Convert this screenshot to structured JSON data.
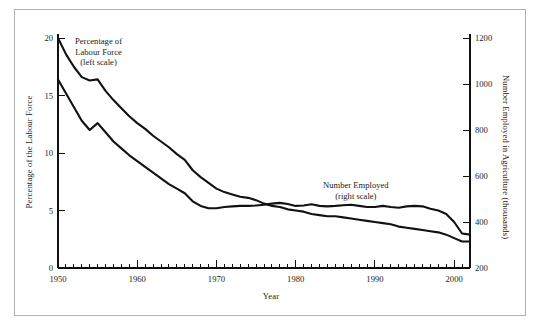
{
  "figure": {
    "background": "#ffffff",
    "border_color": "#b0b0b0",
    "line_color": "#111111"
  },
  "chart_data": {
    "type": "line",
    "title": "",
    "xlabel": "Year",
    "ylabel": "Percentage of the Labour Force",
    "ylabel_right": "Number Employed in Agriculture (thousands)",
    "xlim": [
      1950,
      2002
    ],
    "ylim": [
      0,
      20
    ],
    "ylim_right": [
      200,
      1200
    ],
    "grid": false,
    "legend_position": "inline-annotations",
    "xticks": [
      1950,
      1960,
      1970,
      1980,
      1990,
      2000
    ],
    "xtick_labels": [
      "1950",
      "1960",
      "1970",
      "1980",
      "1990",
      "2000"
    ],
    "minor_xtick_interval": 1,
    "yticks": [
      0,
      5,
      10,
      15,
      20
    ],
    "ytick_labels": [
      "0",
      "5",
      "10",
      "15",
      "20"
    ],
    "yticks_right": [
      200,
      400,
      600,
      800,
      1000,
      1200
    ],
    "ytick_labels_right": [
      "200",
      "400",
      "600",
      "800",
      "1000",
      "1200"
    ],
    "annotations": [
      {
        "id": "left-series",
        "lines": [
          "Percentage of",
          "Labour Force",
          "(left scale)"
        ],
        "x": 1954.5,
        "y": 18.6
      },
      {
        "id": "right-series",
        "lines": [
          "Number Employed",
          "(right scale)"
        ],
        "x": 1985.0,
        "y": 7.2
      }
    ],
    "series": [
      {
        "name": "Percentage of Labour Force (left scale)",
        "axis": "left",
        "units": "percent",
        "x": [
          1950,
          1951,
          1952,
          1953,
          1954,
          1955,
          1956,
          1957,
          1958,
          1959,
          1960,
          1961,
          1962,
          1963,
          1964,
          1965,
          1966,
          1967,
          1968,
          1969,
          1970,
          1971,
          1972,
          1973,
          1974,
          1975,
          1976,
          1977,
          1978,
          1979,
          1980,
          1981,
          1982,
          1983,
          1984,
          1985,
          1986,
          1987,
          1988,
          1989,
          1990,
          1991,
          1992,
          1993,
          1994,
          1995,
          1996,
          1997,
          1998,
          1999,
          2000,
          2001,
          2002
        ],
        "values": [
          20.0,
          18.6,
          17.5,
          16.6,
          16.3,
          16.4,
          15.4,
          14.6,
          13.9,
          13.2,
          12.6,
          12.1,
          11.5,
          11.0,
          10.5,
          9.9,
          9.4,
          8.5,
          7.9,
          7.4,
          6.9,
          6.6,
          6.4,
          6.2,
          6.1,
          5.9,
          5.6,
          5.4,
          5.3,
          5.1,
          5.0,
          4.9,
          4.7,
          4.6,
          4.5,
          4.5,
          4.4,
          4.3,
          4.2,
          4.1,
          4.0,
          3.9,
          3.8,
          3.6,
          3.5,
          3.4,
          3.3,
          3.2,
          3.1,
          2.9,
          2.6,
          2.3,
          2.3
        ]
      },
      {
        "name": "Number Employed in Agriculture (right scale)",
        "axis": "right",
        "units": "thousands",
        "x": [
          1950,
          1951,
          1952,
          1953,
          1954,
          1955,
          1956,
          1957,
          1958,
          1959,
          1960,
          1961,
          1962,
          1963,
          1964,
          1965,
          1966,
          1967,
          1968,
          1969,
          1970,
          1971,
          1972,
          1973,
          1974,
          1975,
          1976,
          1977,
          1978,
          1979,
          1980,
          1981,
          1982,
          1983,
          1984,
          1985,
          1986,
          1987,
          1988,
          1989,
          1990,
          1991,
          1992,
          1993,
          1994,
          1995,
          1996,
          1997,
          1998,
          1999,
          2000,
          2001,
          2002
        ],
        "values": [
          1020,
          960,
          900,
          840,
          800,
          830,
          790,
          750,
          720,
          690,
          665,
          640,
          615,
          590,
          565,
          545,
          525,
          490,
          470,
          460,
          460,
          465,
          468,
          470,
          470,
          472,
          475,
          480,
          483,
          478,
          470,
          472,
          477,
          470,
          468,
          470,
          473,
          475,
          470,
          465,
          465,
          470,
          465,
          462,
          468,
          470,
          468,
          458,
          450,
          435,
          400,
          350,
          345
        ]
      }
    ]
  }
}
